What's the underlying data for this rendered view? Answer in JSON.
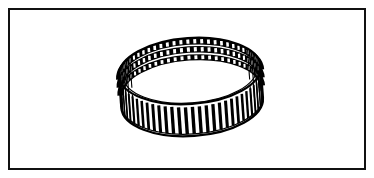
{
  "figure": {
    "title": "Toothed ring gear perspective line drawing",
    "subject_name": "toothed-ring",
    "style": "line-art",
    "background_color": "#ffffff",
    "ink_color": "#000000"
  },
  "frame": {
    "name": "border-frame",
    "x": 8,
    "y": 8,
    "width": 358,
    "height": 162,
    "stroke_color": "#111111",
    "stroke_width": 2,
    "fill_color": "#ffffff"
  },
  "ring": {
    "name": "toothed-ring",
    "center_x": 191,
    "center_y": 87,
    "radius_x": 71,
    "radius_y": 33,
    "band_height": 32,
    "rotation_deg": -4,
    "tooth_count": 64,
    "tooth_rows": 3,
    "outline_color": "#000000",
    "outline_width": 2.2,
    "tooth_light_color": "#ffffff",
    "tooth_dark_color": "#000000",
    "top_rim_label": "top-rim-ellipse",
    "bottom_rim_label": "bottom-rim-ellipse",
    "top_band_style": "white-teeth-on-black",
    "bottom_band_style": "black-teeth-on-white"
  },
  "measurements": {
    "image_width": 374,
    "image_height": 178,
    "ring_left": 120,
    "ring_right": 262,
    "ring_top": 22,
    "ring_bottom": 152
  }
}
